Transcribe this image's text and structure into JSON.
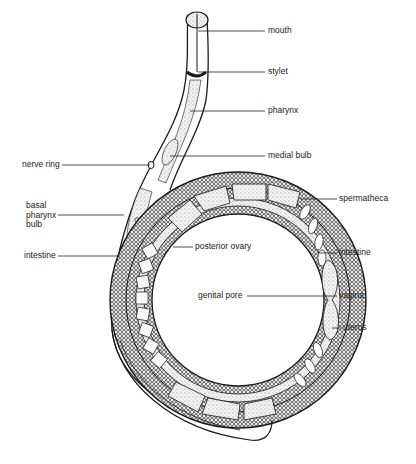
{
  "diagram": {
    "style": "black and white stipple illustration",
    "labels": {
      "mouth": "mouth",
      "stylet": "stylet",
      "pharynx": "pharynx",
      "medial_bulb": "medial bulb",
      "nerve_ring": "nerve ring",
      "basal_pharynx_bulb": "basal\npharynx\nbulb",
      "intestine_left": "intestine",
      "posterior_ovary": "posterior ovary",
      "spermatheca": "spermatheca",
      "intestine_right": "intestine",
      "genital_pore": "genital pore",
      "vagina": "vagina",
      "uterus": "uterus"
    },
    "colors": {
      "ink": "#1a1a1a",
      "background": "#ffffff",
      "stipple_fill": "#e8e8e8"
    }
  }
}
